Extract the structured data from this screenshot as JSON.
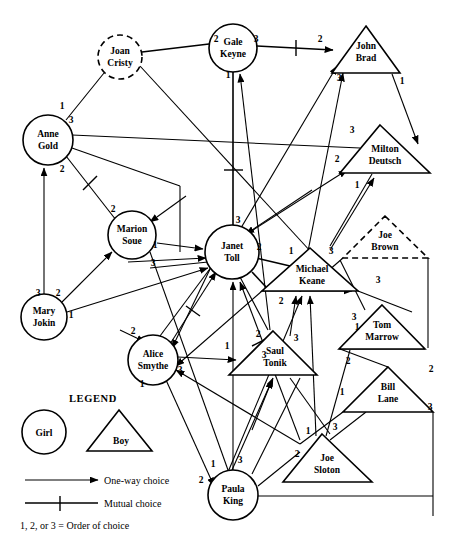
{
  "legend": {
    "heading": "LEGEND",
    "girl_label": "Girl",
    "boy_label": "Boy",
    "one_way_label": "One-way choice",
    "mutual_label": "Mutual choice",
    "order_note": "1, 2, or 3 = Order of choice"
  },
  "colors": {
    "stroke": "#000000",
    "fill": "#ffffff",
    "background": "#ffffff"
  },
  "nodes": [
    {
      "id": "joan",
      "name": "Joan\nCristy",
      "line1": "Joan",
      "line2": "Cristy",
      "shape": "circle",
      "style": "dashed",
      "cx": 120,
      "cy": 57,
      "r": 22
    },
    {
      "id": "gale",
      "name": "Gale Keyne",
      "line1": "Gale",
      "line2": "Keyne",
      "shape": "circle",
      "style": "solid",
      "cx": 233,
      "cy": 48,
      "r": 24
    },
    {
      "id": "john",
      "name": "John Brad",
      "line1": "John",
      "line2": "Brad",
      "shape": "triangle",
      "style": "solid",
      "cx": 366,
      "cy": 50,
      "w": 68,
      "h": 47
    },
    {
      "id": "anne",
      "name": "Anne Gold",
      "line1": "Anne",
      "line2": "Gold",
      "shape": "circle",
      "style": "solid",
      "cx": 48,
      "cy": 140,
      "r": 25
    },
    {
      "id": "milton",
      "name": "Milton Deutsch",
      "line1": "Milton",
      "line2": "Deutsch",
      "shape": "triangle",
      "style": "solid",
      "cx": 385,
      "cy": 150,
      "w": 90,
      "h": 48
    },
    {
      "id": "marion",
      "name": "Marion Soue",
      "line1": "Marion",
      "line2": "Soue",
      "shape": "circle",
      "style": "solid",
      "cx": 132,
      "cy": 235,
      "r": 24
    },
    {
      "id": "janet",
      "name": "Janet Toll",
      "line1": "Janet",
      "line2": "Toll",
      "shape": "circle",
      "style": "solid",
      "cx": 232,
      "cy": 252,
      "r": 27
    },
    {
      "id": "joeb",
      "name": "Joe Brown",
      "line1": "Joe",
      "line2": "Brown",
      "shape": "triangle",
      "style": "dashed",
      "cx": 385,
      "cy": 237,
      "w": 85,
      "h": 42
    },
    {
      "id": "michael",
      "name": "Michael Keane",
      "line1": "Michael",
      "line2": "Keane",
      "shape": "triangle",
      "style": "solid",
      "cx": 310,
      "cy": 270,
      "w": 96,
      "h": 43
    },
    {
      "id": "mary",
      "name": "Mary Jokin",
      "line1": "Mary",
      "line2": "Jokin",
      "shape": "circle",
      "style": "solid",
      "cx": 44,
      "cy": 317,
      "r": 23
    },
    {
      "id": "tom",
      "name": "Tom Marrow",
      "line1": "Tom",
      "line2": "Marrow",
      "shape": "triangle",
      "style": "solid",
      "cx": 382,
      "cy": 327,
      "w": 85,
      "h": 44
    },
    {
      "id": "alice",
      "name": "Alice Smythe",
      "line1": "Alice",
      "line2": "Smythe",
      "shape": "circle",
      "style": "solid",
      "cx": 153,
      "cy": 360,
      "r": 25
    },
    {
      "id": "saul",
      "name": "Saul Tonik",
      "line1": "Saul",
      "line2": "Tonik",
      "shape": "triangle",
      "style": "solid",
      "cx": 273,
      "cy": 354,
      "w": 88,
      "h": 44
    },
    {
      "id": "bill",
      "name": "Bill Lane",
      "line1": "Bill",
      "line2": "Lane",
      "shape": "triangle",
      "style": "solid",
      "cx": 388,
      "cy": 389,
      "w": 90,
      "h": 45
    },
    {
      "id": "joes",
      "name": "Joe Sloton",
      "line1": "Joe",
      "line2": "Sloton",
      "shape": "triangle",
      "style": "solid",
      "cx": 327,
      "cy": 458,
      "w": 89,
      "h": 48
    },
    {
      "id": "paula",
      "name": "Paula King",
      "line1": "Paula",
      "line2": "King",
      "shape": "circle",
      "style": "solid",
      "cx": 233,
      "cy": 495,
      "r": 25
    }
  ],
  "order_labels": [
    {
      "text": "2",
      "x": 216,
      "y": 42
    },
    {
      "text": "3",
      "x": 256,
      "y": 42
    },
    {
      "text": "2",
      "x": 320,
      "y": 42
    },
    {
      "text": "1",
      "x": 228,
      "y": 78
    },
    {
      "text": "3",
      "x": 339,
      "y": 81
    },
    {
      "text": "1",
      "x": 402,
      "y": 84
    },
    {
      "text": "1",
      "x": 62,
      "y": 109
    },
    {
      "text": "3",
      "x": 71,
      "y": 123
    },
    {
      "text": "3",
      "x": 352,
      "y": 133
    },
    {
      "text": "2",
      "x": 337,
      "y": 162
    },
    {
      "text": "2",
      "x": 62,
      "y": 172
    },
    {
      "text": "1",
      "x": 357,
      "y": 188
    },
    {
      "text": "2",
      "x": 113,
      "y": 212
    },
    {
      "text": "3",
      "x": 238,
      "y": 223
    },
    {
      "text": "1",
      "x": 155,
      "y": 248
    },
    {
      "text": "2",
      "x": 259,
      "y": 250
    },
    {
      "text": "1",
      "x": 291,
      "y": 254
    },
    {
      "text": "3",
      "x": 331,
      "y": 254
    },
    {
      "text": "3",
      "x": 153,
      "y": 266
    },
    {
      "text": "3",
      "x": 378,
      "y": 283
    },
    {
      "text": "3",
      "x": 38,
      "y": 296
    },
    {
      "text": "2",
      "x": 58,
      "y": 296
    },
    {
      "text": "1",
      "x": 71,
      "y": 318
    },
    {
      "text": "2",
      "x": 281,
      "y": 304
    },
    {
      "text": "3",
      "x": 354,
      "y": 320
    },
    {
      "text": "1",
      "x": 357,
      "y": 330
    },
    {
      "text": "2",
      "x": 133,
      "y": 334
    },
    {
      "text": "2",
      "x": 258,
      "y": 337
    },
    {
      "text": "3",
      "x": 296,
      "y": 341
    },
    {
      "text": "1",
      "x": 227,
      "y": 349
    },
    {
      "text": "3",
      "x": 180,
      "y": 373
    },
    {
      "text": "3",
      "x": 264,
      "y": 358
    },
    {
      "text": "2",
      "x": 348,
      "y": 364
    },
    {
      "text": "2",
      "x": 431,
      "y": 372
    },
    {
      "text": "1",
      "x": 142,
      "y": 387
    },
    {
      "text": "1",
      "x": 342,
      "y": 395
    },
    {
      "text": "3",
      "x": 430,
      "y": 410
    },
    {
      "text": "1",
      "x": 308,
      "y": 434
    },
    {
      "text": "3",
      "x": 335,
      "y": 430
    },
    {
      "text": "2",
      "x": 297,
      "y": 457
    },
    {
      "text": "1",
      "x": 213,
      "y": 467
    },
    {
      "text": "3",
      "x": 240,
      "y": 463
    },
    {
      "text": "2",
      "x": 201,
      "y": 483
    }
  ],
  "legend_geometry": {
    "heading_x": 93,
    "heading_y": 402,
    "girl_cx": 44,
    "girl_cy": 432,
    "girl_r": 22,
    "boy_apex_x": 119,
    "boy_apex_y": 410,
    "boy_left_x": 87,
    "boy_right_x": 152,
    "boy_base_y": 451,
    "arrow_y": 480,
    "arrow_x1": 25,
    "arrow_x2": 98,
    "mutual_y": 503,
    "mutual_x1": 25,
    "mutual_x2": 98,
    "text_x": 104,
    "note_x": 20,
    "note_y": 526
  }
}
